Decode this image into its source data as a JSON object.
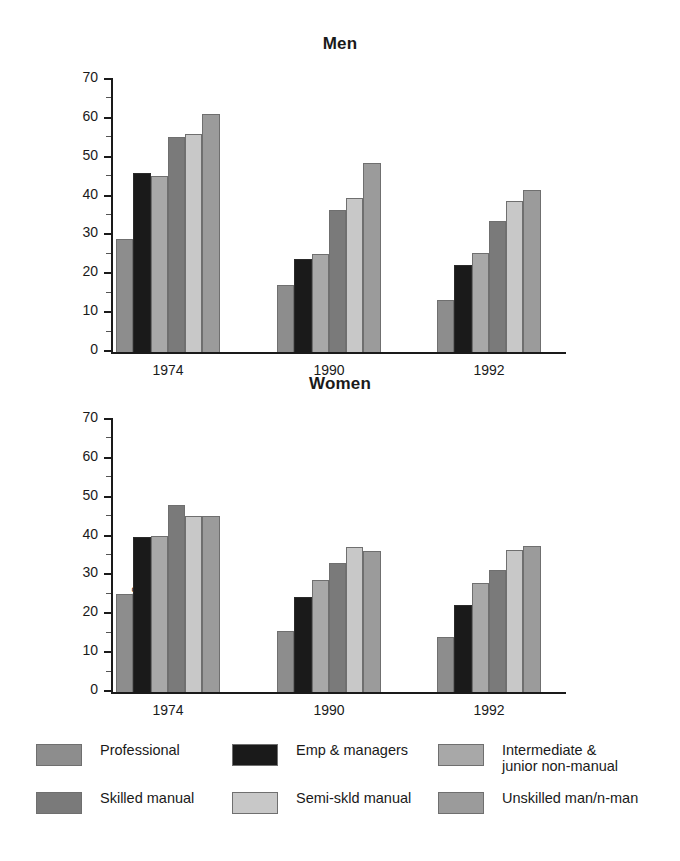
{
  "chart_data": {
    "type": "bar",
    "panels": [
      {
        "title": "Men",
        "ylabel": "Percentage",
        "xlabel": "",
        "ylim": [
          0,
          70
        ],
        "yticks": [
          0,
          10,
          20,
          30,
          40,
          50,
          60,
          70
        ],
        "categories": [
          "1974",
          "1990",
          "1992"
        ],
        "series": [
          {
            "name": "Professional",
            "color": "#8d8d8d",
            "values": [
              29.0,
              17.2,
              13.4
            ]
          },
          {
            "name": "Emp & managers",
            "color": "#1a1a1a",
            "values": [
              46.1,
              24.0,
              22.5
            ]
          },
          {
            "name": "Intermediate & junior non-manual",
            "color": "#a8a8a8",
            "values": [
              45.3,
              25.2,
              25.4
            ]
          },
          {
            "name": "Skilled manual",
            "color": "#7a7a7a",
            "values": [
              55.3,
              36.5,
              33.7
            ]
          },
          {
            "name": "Semi-skld manual",
            "color": "#c8c8c8",
            "values": [
              56.2,
              39.7,
              38.9
            ]
          },
          {
            "name": "Unskilled man/n-man",
            "color": "#9b9b9b",
            "values": [
              61.2,
              48.7,
              41.7
            ]
          }
        ]
      },
      {
        "title": "Women",
        "ylabel": "Percentage",
        "xlabel": "",
        "ylim": [
          0,
          70
        ],
        "yticks": [
          0,
          10,
          20,
          30,
          40,
          50,
          60,
          70
        ],
        "categories": [
          "1974",
          "1990",
          "1992"
        ],
        "series": [
          {
            "name": "Professional",
            "color": "#8d8d8d",
            "values": [
              25.1,
              15.8,
              14.1
            ]
          },
          {
            "name": "Emp & managers",
            "color": "#1a1a1a",
            "values": [
              40.0,
              24.4,
              22.4
            ]
          },
          {
            "name": "Intermediate & junior non-manual",
            "color": "#a8a8a8",
            "values": [
              40.2,
              28.8,
              28.0
            ]
          },
          {
            "name": "Skilled manual",
            "color": "#7a7a7a",
            "values": [
              48.2,
              33.1,
              31.4
            ]
          },
          {
            "name": "Semi-skld manual",
            "color": "#c8c8c8",
            "values": [
              45.2,
              37.2,
              36.6
            ]
          },
          {
            "name": "Unskilled man/n-man",
            "color": "#9b9b9b",
            "values": [
              45.2,
              36.3,
              37.5
            ]
          }
        ]
      }
    ],
    "legend": {
      "position": "bottom",
      "entries": [
        {
          "label": "Professional",
          "color": "#8d8d8d"
        },
        {
          "label": "Emp & managers",
          "color": "#1a1a1a"
        },
        {
          "label": "Intermediate &\njunior non-manual",
          "color": "#a8a8a8"
        },
        {
          "label": "Skilled manual",
          "color": "#7a7a7a"
        },
        {
          "label": "Semi-skld manual",
          "color": "#c8c8c8"
        },
        {
          "label": "Unskilled man/n-man",
          "color": "#9b9b9b"
        }
      ]
    },
    "grid": false
  }
}
